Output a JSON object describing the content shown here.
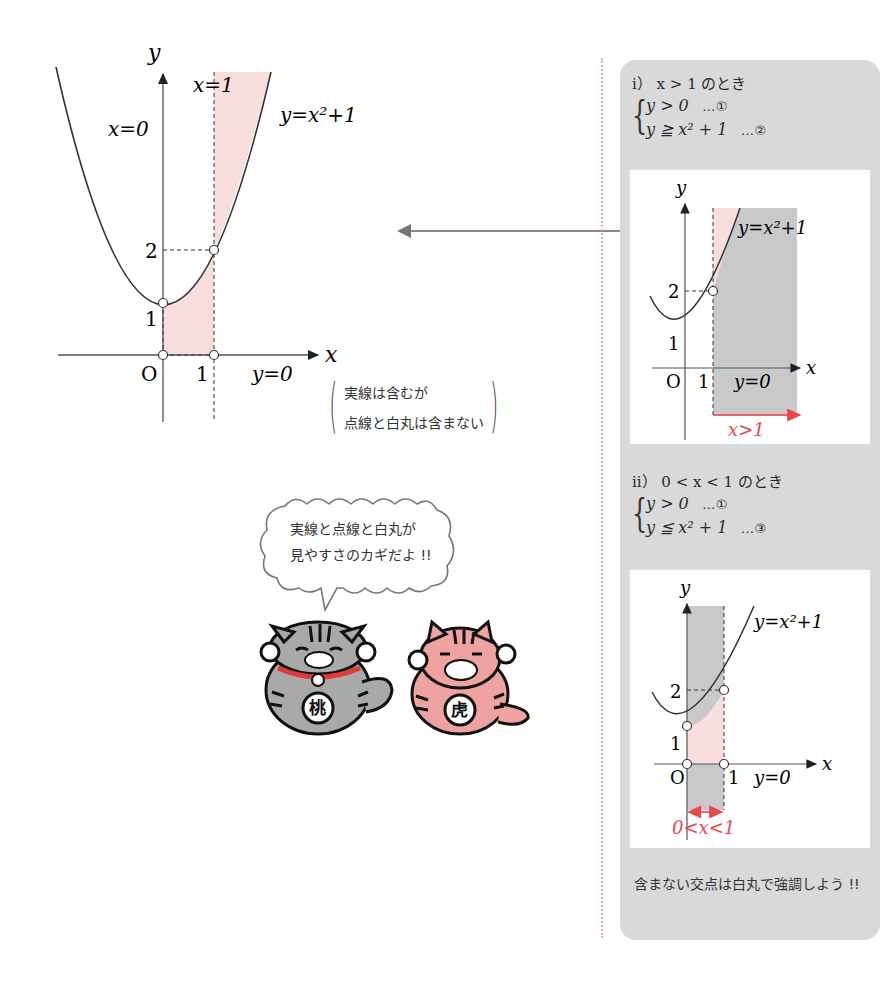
{
  "main_graph": {
    "axis_x_label": "x",
    "axis_y_label": "y",
    "origin_label": "O",
    "tick_x1": "1",
    "tick_y1": "1",
    "tick_y2": "2",
    "label_x0": "x=0",
    "label_x1": "x=1",
    "label_y0": "y=0",
    "curve_label": "y=x²+1",
    "shade_color": "#f9dede"
  },
  "legend_note": {
    "line1": "実線は含むが",
    "line2": "点線と白丸は含まない"
  },
  "speech_bubble": {
    "line1": "実線と点線と白丸が",
    "line2": "見やすさのカギだよ !!"
  },
  "characters": [
    {
      "name": "gray-cat",
      "badge": "桃",
      "color": "#a9a9a9"
    },
    {
      "name": "pink-cat",
      "badge": "虎",
      "color": "#eea3a0"
    }
  ],
  "panel": {
    "case1": {
      "title": "i） x > 1 のとき",
      "eq1": "y > 0",
      "eq1_tag": "…①",
      "eq2": "y ≧ x² + 1",
      "eq2_tag": "…②",
      "graph": {
        "axis_x_label": "x",
        "axis_y_label": "y",
        "origin_label": "O",
        "tick_x1": "1",
        "tick_y1": "1",
        "tick_y2": "2",
        "curve_label": "y=x²+1",
        "label_y0": "y=0",
        "range_label": "x>1"
      }
    },
    "case2": {
      "title": "ii） 0 < x < 1 のとき",
      "eq1": "y > 0",
      "eq1_tag": "…①",
      "eq2": "y ≦ x² + 1",
      "eq2_tag": "…③",
      "graph": {
        "axis_x_label": "x",
        "axis_y_label": "y",
        "origin_label": "O",
        "tick_x1": "1",
        "tick_y1": "1",
        "tick_y2": "2",
        "curve_label": "y=x²+1",
        "label_y0": "y=0",
        "range_label": "0<x<1"
      }
    },
    "note": "含まない交点は白丸で強調しよう !!"
  },
  "colors": {
    "pink_shade": "#f9dede",
    "gray_shade": "#c9c9c9",
    "panel_bg": "#d9d9d9",
    "accent_red": "#e8474c",
    "divider": "#e8a9b3"
  }
}
